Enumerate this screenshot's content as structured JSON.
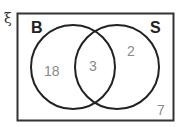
{
  "diagram": {
    "type": "venn",
    "universal_symbol": "ξ",
    "sets": [
      {
        "name": "B",
        "only_count": "18"
      },
      {
        "name": "S",
        "only_count": "2"
      }
    ],
    "intersection_count": "3",
    "outside_count": "7"
  }
}
